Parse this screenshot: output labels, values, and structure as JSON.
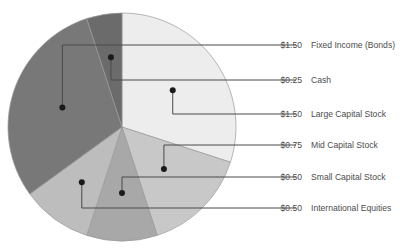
{
  "chart_data": {
    "type": "pie",
    "title": "",
    "value_prefix": "$",
    "total": 5.0,
    "start_angle_deg": 0,
    "direction": "clockwise",
    "legend_position": "right-callout",
    "categories": [
      "Large Capital Stock",
      "Mid Capital Stock",
      "Small Capital Stock",
      "International Equities",
      "Fixed Income (Bonds)",
      "Cash"
    ],
    "values": [
      1.5,
      0.75,
      0.5,
      0.5,
      1.5,
      0.25
    ],
    "value_labels": [
      "$1.50",
      "$0.75",
      "$0.50",
      "$0.50",
      "$1.50",
      "$0.25"
    ],
    "colors": [
      "#ededed",
      "#c8c8c8",
      "#a8a8a8",
      "#bdbdbd",
      "#787878",
      "#6b6b6b"
    ]
  },
  "callouts": [
    {
      "value": "$1.50",
      "name": "Fixed Income (Bonds)",
      "slice_index": 4
    },
    {
      "value": "$0.25",
      "name": "Cash",
      "slice_index": 5
    },
    {
      "value": "$1.50",
      "name": "Large Capital Stock",
      "slice_index": 0
    },
    {
      "value": "$0.75",
      "name": "Mid Capital Stock",
      "slice_index": 1
    },
    {
      "value": "$0.50",
      "name": "Small Capital Stock",
      "slice_index": 2
    },
    {
      "value": "$0.50",
      "name": "International Equities",
      "slice_index": 3
    }
  ]
}
